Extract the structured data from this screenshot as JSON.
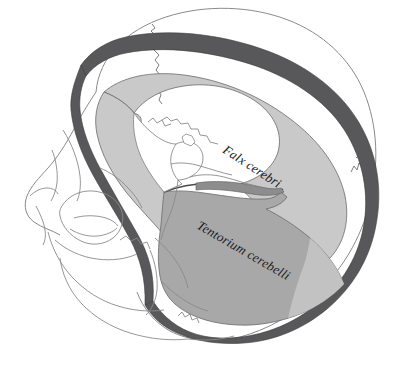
{
  "figure": {
    "view": "lateral oblique cutaway of the cranium",
    "background_color": "#ffffff",
    "width": 399,
    "height": 368
  },
  "labels": [
    {
      "id": "falx-cerebri",
      "text": "Falx cerebri",
      "style": "italic-serif",
      "font_size": 13,
      "rotation_deg": 33,
      "x": 222,
      "y": 152,
      "color": "#1a1a1a"
    },
    {
      "id": "tentorium-cerebelli",
      "text": "Tentorium cerebelli",
      "style": "italic-serif",
      "font_size": 13,
      "rotation_deg": 30,
      "x": 196,
      "y": 228,
      "color": "#1a1a1a"
    }
  ],
  "structures": [
    {
      "id": "skull-outline",
      "name": "skull bone outline",
      "stroke": "#8a8a8a",
      "stroke_width": 0.9,
      "fill": "none"
    },
    {
      "id": "cranial-sutures",
      "name": "coronal and lambdoid sutures",
      "stroke": "#6e6e6e",
      "stroke_width": 0.9,
      "fill": "none"
    },
    {
      "id": "dura-rim",
      "name": "dura mater lining the cranial vault",
      "fill": "#58585a",
      "stroke": "#3a3a3c",
      "stroke_width": 0.7
    },
    {
      "id": "falx-cerebri-sheet",
      "name": "falx cerebri membrane",
      "fill": "#c9c9c9",
      "stroke": "#6a6a6a",
      "stroke_width": 0.8
    },
    {
      "id": "tentorium-cerebelli-sheet",
      "name": "tentorium cerebelli membrane",
      "fill": "#a8a8a8",
      "stroke": "#6a6a6a",
      "stroke_width": 0.8
    },
    {
      "id": "tentorium-highlight",
      "name": "tentorium posterior highlight fold",
      "fill": "#c2c2c2",
      "stroke": "none"
    },
    {
      "id": "skull-base",
      "name": "skull base with sella turcica and petrous ridge",
      "stroke": "#8a8a8a",
      "stroke_width": 0.9,
      "fill": "#ffffff"
    },
    {
      "id": "facial-bones",
      "name": "orbital, zygomatic and maxillary outlines",
      "stroke": "#8a8a8a",
      "stroke_width": 0.9,
      "fill": "none"
    }
  ],
  "palette": {
    "line": "#8a8a8a",
    "dura_dark": "#58585a",
    "falx_light": "#c9c9c9",
    "tentorium_mid": "#a8a8a8",
    "tentorium_highlight": "#c2c2c2",
    "text": "#1a1a1a",
    "background": "#ffffff"
  }
}
